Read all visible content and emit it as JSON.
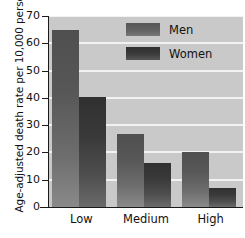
{
  "chart_data": {
    "type": "bar",
    "title": "",
    "xlabel": "",
    "ylabel": "Age-adjusted death rate per 10,000 persons",
    "categories": [
      "Low",
      "Medium",
      "High"
    ],
    "series": [
      {
        "name": "Men",
        "values": [
          64.8,
          26.7,
          20.3
        ],
        "color": "#5a5a5a"
      },
      {
        "name": "Women",
        "values": [
          40.2,
          16.0,
          7.0
        ],
        "color": "#343434"
      }
    ],
    "ylim": [
      0,
      70
    ],
    "yticks": [
      0,
      10,
      20,
      30,
      40,
      50,
      60,
      70
    ],
    "ytick_labels": [
      "0",
      "10",
      "20",
      "30",
      "40",
      "50",
      "60",
      "70"
    ],
    "grid": "horizontal",
    "legend_position": "top-right",
    "plot_background": "#c9c9c9",
    "gridline_color": "#f2f2f2"
  },
  "legend": {
    "items": [
      {
        "label": "Men"
      },
      {
        "label": "Women"
      }
    ]
  }
}
